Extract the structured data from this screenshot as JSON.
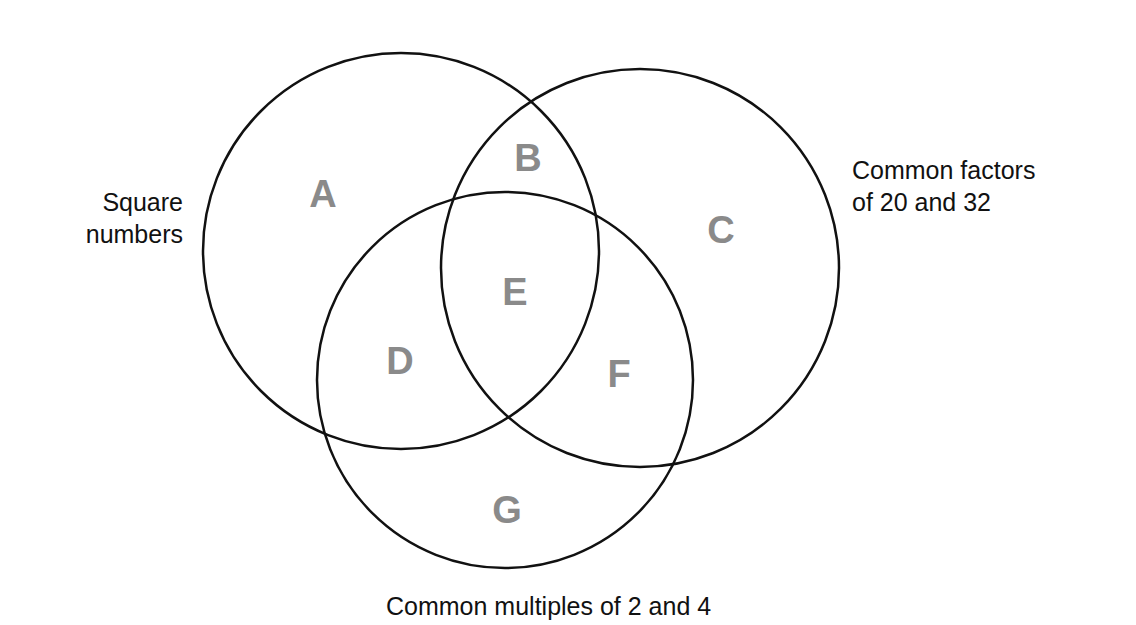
{
  "diagram": {
    "type": "venn",
    "sets": [
      {
        "id": "square",
        "label_lines": [
          "Square",
          "numbers"
        ]
      },
      {
        "id": "factors",
        "label_lines": [
          "Common factors",
          "of 20 and 32"
        ]
      },
      {
        "id": "multiples",
        "label": "Common multiples of 2 and 4"
      }
    ],
    "regions": {
      "A": "A",
      "B": "B",
      "C": "C",
      "D": "D",
      "E": "E",
      "F": "F",
      "G": "G"
    },
    "colors": {
      "stroke": "#111111",
      "region_label": "#8a8a8a",
      "text": "#111111"
    }
  }
}
